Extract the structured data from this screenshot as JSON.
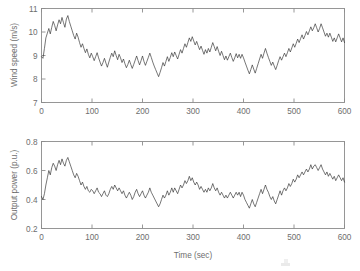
{
  "chart_data": [
    {
      "type": "line",
      "panel": "top",
      "title": "",
      "xlabel": "",
      "ylabel": "Wind speed (m/s)",
      "xlim": [
        0,
        600
      ],
      "ylim": [
        7,
        11
      ],
      "xticks": [
        0,
        100,
        200,
        300,
        400,
        500,
        600
      ],
      "yticks": [
        7,
        8,
        9,
        10,
        11
      ],
      "grid": false,
      "legend": null,
      "series": [
        {
          "name": "Wind speed",
          "color": "#2b2b2b",
          "x": [
            0,
            3,
            6,
            9,
            12,
            15,
            18,
            21,
            24,
            27,
            30,
            33,
            36,
            39,
            42,
            45,
            48,
            51,
            54,
            57,
            60,
            63,
            66,
            69,
            72,
            75,
            78,
            81,
            84,
            87,
            90,
            93,
            96,
            99,
            102,
            105,
            108,
            111,
            114,
            117,
            120,
            123,
            126,
            129,
            132,
            135,
            138,
            141,
            144,
            147,
            150,
            153,
            156,
            159,
            162,
            165,
            168,
            171,
            174,
            177,
            180,
            183,
            186,
            189,
            192,
            195,
            198,
            201,
            204,
            207,
            210,
            213,
            216,
            219,
            222,
            225,
            228,
            231,
            234,
            237,
            240,
            243,
            246,
            249,
            252,
            255,
            258,
            261,
            264,
            267,
            270,
            273,
            276,
            279,
            282,
            285,
            288,
            291,
            294,
            297,
            300,
            303,
            306,
            309,
            312,
            315,
            318,
            321,
            324,
            327,
            330,
            333,
            336,
            339,
            342,
            345,
            348,
            351,
            354,
            357,
            360,
            363,
            366,
            369,
            372,
            375,
            378,
            381,
            384,
            387,
            390,
            393,
            396,
            399,
            402,
            405,
            408,
            411,
            414,
            417,
            420,
            423,
            426,
            429,
            432,
            435,
            438,
            441,
            444,
            447,
            450,
            453,
            456,
            459,
            462,
            465,
            468,
            471,
            474,
            477,
            480,
            483,
            486,
            489,
            492,
            495,
            498,
            501,
            504,
            507,
            510,
            513,
            516,
            519,
            522,
            525,
            528,
            531,
            534,
            537,
            540,
            543,
            546,
            549,
            552,
            555,
            558,
            561,
            564,
            567,
            570,
            573,
            576,
            579,
            582,
            585,
            588,
            591,
            594,
            597,
            600
          ],
          "values": [
            8.95,
            8.88,
            9.3,
            9.75,
            9.95,
            10.15,
            9.92,
            10.2,
            10.45,
            10.28,
            10.05,
            10.3,
            10.52,
            10.35,
            10.62,
            10.4,
            10.2,
            10.55,
            10.7,
            10.45,
            10.25,
            10.05,
            9.85,
            9.7,
            9.95,
            9.78,
            9.55,
            9.35,
            9.5,
            9.3,
            9.12,
            9.28,
            9.05,
            8.9,
            9.1,
            8.95,
            8.78,
            8.95,
            9.12,
            8.9,
            8.72,
            8.55,
            8.7,
            8.88,
            8.68,
            8.5,
            8.72,
            8.92,
            9.1,
            8.95,
            9.2,
            9.0,
            8.82,
            9.05,
            8.9,
            8.7,
            8.85,
            8.65,
            8.48,
            8.62,
            8.8,
            8.62,
            8.45,
            8.62,
            8.8,
            8.98,
            8.78,
            8.6,
            8.78,
            8.98,
            8.75,
            8.58,
            8.75,
            8.92,
            9.1,
            8.92,
            8.72,
            8.55,
            8.4,
            8.25,
            8.1,
            8.28,
            8.48,
            8.7,
            8.55,
            8.75,
            8.95,
            8.75,
            8.92,
            9.12,
            8.95,
            9.15,
            9.0,
            8.85,
            9.05,
            9.25,
            9.1,
            9.3,
            9.5,
            9.35,
            9.55,
            9.75,
            9.6,
            9.8,
            9.62,
            9.45,
            9.6,
            9.42,
            9.25,
            9.4,
            9.22,
            9.05,
            9.25,
            9.1,
            9.3,
            9.15,
            9.35,
            9.55,
            9.38,
            9.2,
            9.38,
            9.18,
            9.0,
            9.18,
            9.0,
            8.82,
            8.98,
            8.8,
            8.95,
            9.1,
            8.92,
            8.75,
            8.9,
            9.08,
            8.9,
            9.05,
            8.88,
            9.05,
            8.9,
            8.72,
            8.55,
            8.38,
            8.22,
            8.4,
            8.6,
            8.42,
            8.25,
            8.45,
            8.65,
            8.85,
            9.05,
            8.88,
            9.1,
            9.3,
            9.1,
            8.92,
            8.75,
            8.58,
            8.72,
            8.55,
            8.4,
            8.58,
            8.78,
            8.95,
            8.8,
            8.95,
            9.1,
            8.95,
            9.12,
            9.3,
            9.15,
            9.32,
            9.5,
            9.35,
            9.52,
            9.7,
            9.55,
            9.72,
            9.88,
            9.7,
            9.85,
            10.02,
            9.88,
            10.05,
            10.22,
            10.05,
            10.18,
            10.35,
            10.18,
            10.0,
            10.15,
            10.35,
            10.18,
            10.0,
            9.82,
            9.95,
            9.78,
            9.95,
            9.78,
            9.6,
            9.75,
            9.58,
            9.75,
            9.92,
            9.75,
            9.58,
            9.75,
            9.55
          ]
        }
      ]
    },
    {
      "type": "line",
      "panel": "bottom",
      "title": "",
      "xlabel": "Time (sec)",
      "ylabel": "Output power (p.u.)",
      "xlim": [
        0,
        600
      ],
      "ylim": [
        0.2,
        0.8
      ],
      "xticks": [
        0,
        100,
        200,
        300,
        400,
        500,
        600
      ],
      "yticks": [
        0.2,
        0.4,
        0.6,
        0.8
      ],
      "grid": false,
      "legend": null,
      "series": [
        {
          "name": "Output power",
          "color": "#2b2b2b",
          "values": [
            0.42,
            0.4,
            0.44,
            0.5,
            0.55,
            0.6,
            0.57,
            0.62,
            0.65,
            0.63,
            0.6,
            0.64,
            0.67,
            0.64,
            0.68,
            0.65,
            0.63,
            0.67,
            0.69,
            0.66,
            0.63,
            0.6,
            0.57,
            0.55,
            0.58,
            0.56,
            0.53,
            0.5,
            0.52,
            0.49,
            0.47,
            0.49,
            0.46,
            0.45,
            0.47,
            0.46,
            0.44,
            0.46,
            0.48,
            0.45,
            0.44,
            0.42,
            0.44,
            0.46,
            0.43,
            0.42,
            0.44,
            0.47,
            0.49,
            0.47,
            0.5,
            0.48,
            0.46,
            0.48,
            0.46,
            0.44,
            0.46,
            0.43,
            0.41,
            0.43,
            0.45,
            0.43,
            0.4,
            0.42,
            0.45,
            0.47,
            0.44,
            0.42,
            0.44,
            0.46,
            0.43,
            0.41,
            0.43,
            0.45,
            0.48,
            0.45,
            0.43,
            0.41,
            0.39,
            0.37,
            0.35,
            0.37,
            0.4,
            0.43,
            0.41,
            0.43,
            0.46,
            0.43,
            0.45,
            0.48,
            0.45,
            0.48,
            0.46,
            0.44,
            0.47,
            0.5,
            0.48,
            0.5,
            0.53,
            0.51,
            0.53,
            0.56,
            0.53,
            0.55,
            0.52,
            0.5,
            0.52,
            0.5,
            0.47,
            0.49,
            0.47,
            0.45,
            0.47,
            0.45,
            0.48,
            0.46,
            0.48,
            0.51,
            0.48,
            0.46,
            0.48,
            0.45,
            0.43,
            0.45,
            0.43,
            0.41,
            0.43,
            0.41,
            0.43,
            0.45,
            0.43,
            0.41,
            0.43,
            0.45,
            0.43,
            0.45,
            0.42,
            0.45,
            0.43,
            0.4,
            0.38,
            0.36,
            0.34,
            0.37,
            0.4,
            0.37,
            0.35,
            0.38,
            0.41,
            0.44,
            0.47,
            0.44,
            0.47,
            0.5,
            0.47,
            0.45,
            0.42,
            0.4,
            0.42,
            0.39,
            0.37,
            0.4,
            0.43,
            0.46,
            0.43,
            0.46,
            0.48,
            0.46,
            0.48,
            0.51,
            0.49,
            0.51,
            0.54,
            0.52,
            0.54,
            0.57,
            0.55,
            0.57,
            0.59,
            0.57,
            0.59,
            0.61,
            0.59,
            0.61,
            0.64,
            0.61,
            0.63,
            0.64,
            0.62,
            0.6,
            0.62,
            0.64,
            0.61,
            0.59,
            0.57,
            0.59,
            0.56,
            0.58,
            0.56,
            0.54,
            0.56,
            0.53,
            0.55,
            0.57,
            0.55,
            0.53,
            0.55,
            0.52
          ]
        }
      ]
    }
  ],
  "axes": {
    "top": {
      "ylabel": "Wind speed (m/s)",
      "yticklabels": [
        "7",
        "8",
        "9",
        "10",
        "11"
      ],
      "xticklabels": [
        "0",
        "100",
        "200",
        "300",
        "400",
        "500",
        "600"
      ]
    },
    "bottom": {
      "ylabel": "Output power (p.u.)",
      "xlabel": "Time (sec)",
      "yticklabels": [
        "0.2",
        "0.4",
        "0.6",
        "0.8"
      ],
      "xticklabels": [
        "0",
        "100",
        "200",
        "300",
        "400",
        "500",
        "600"
      ]
    }
  },
  "colors": {
    "trace": "#2b2b2b",
    "axis": "#8c8c8c",
    "text": "#6e6e6e",
    "background": "#ffffff"
  }
}
